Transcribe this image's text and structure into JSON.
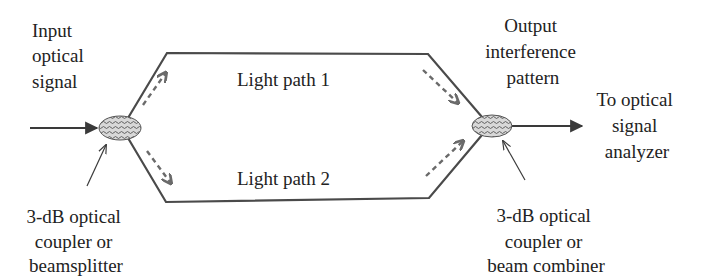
{
  "diagram": {
    "colors": {
      "line": "#4a4a4a",
      "dashed_arrow": "#6a6a6a",
      "text": "#222222",
      "coupler_fill": "#bdbdbd",
      "background": "#ffffff"
    },
    "labels": {
      "input": [
        "Input",
        "optical",
        "signal"
      ],
      "output_pattern": [
        "Output",
        "interference",
        "pattern"
      ],
      "analyzer": [
        "To optical",
        "signal",
        "analyzer"
      ],
      "splitter": [
        "3-dB optical",
        "coupler or",
        "beamsplitter"
      ],
      "combiner": [
        "3-dB optical",
        "coupler or",
        "beam combiner"
      ],
      "path1": "Light path 1",
      "path2": "Light path 2"
    },
    "nodes": {
      "splitter": {
        "name": "3-dB optical coupler or beamsplitter",
        "icon": "hatched-ellipse"
      },
      "combiner": {
        "name": "3-dB optical coupler or beam combiner",
        "icon": "hatched-ellipse"
      }
    }
  }
}
